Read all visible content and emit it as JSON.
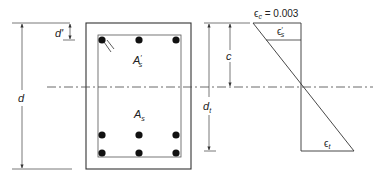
{
  "diagram": {
    "type": "reinforced-concrete-section-strain-diagram",
    "labels": {
      "d_prime": "d'",
      "d": "d",
      "A_s_prime": "A",
      "A_s_prime_sub": "s",
      "A_s_prime_mark": "′",
      "A_s": "A",
      "A_s_sub": "s",
      "c": "c",
      "d_t": "d",
      "d_t_sub": "t",
      "eps_c_symbol": "ϵ",
      "eps_c_sub": "c",
      "eps_c_value": " = 0.003",
      "eps_s_prime": "ϵ",
      "eps_s_prime_sub": "s",
      "eps_s_prime_mark": "′",
      "eps_t": "ϵ",
      "eps_t_sub": "t"
    },
    "section": {
      "top_bars": 3,
      "bottom_bar_rows": 2,
      "bottom_bars_per_row": 3
    },
    "strain": {
      "concrete_strain": "0.003"
    },
    "colors": {
      "line": "#333333",
      "bar": "#111111",
      "background": "#ffffff"
    }
  }
}
